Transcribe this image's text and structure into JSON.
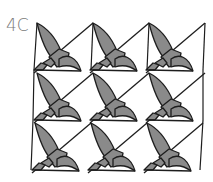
{
  "figure": {
    "label": "4C",
    "grid": {
      "columns": 3,
      "rows": 3
    },
    "colors": {
      "fill": "#8a8a8a",
      "stroke": "#1e1e1e",
      "background": "#ffffff",
      "label": "#7a7a7a"
    }
  }
}
